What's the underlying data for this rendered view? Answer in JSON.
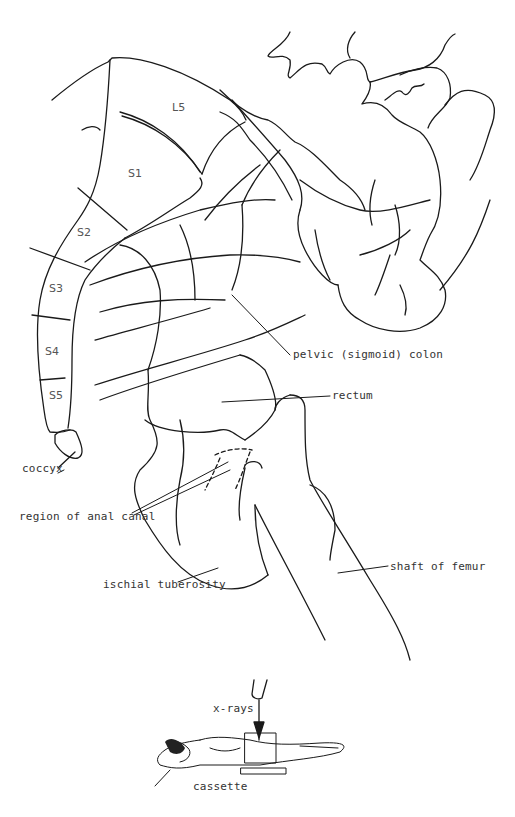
{
  "header": {
    "title": ""
  },
  "vertebrae": [
    "L5",
    "S1",
    "S2",
    "S3",
    "S4",
    "S5"
  ],
  "labels": {
    "coccyx": "coccyx",
    "pelvic_colon": "pelvic (sigmoid) colon",
    "rectum": "rectum",
    "anal_canal": "region of anal canal",
    "ischial": "ischial tuberosity",
    "femur": "shaft of femur",
    "xrays": "x-rays",
    "cassette": "cassette"
  },
  "colors": {
    "line": "#1a1a1a",
    "text": "#333333",
    "background": "#ffffff"
  }
}
